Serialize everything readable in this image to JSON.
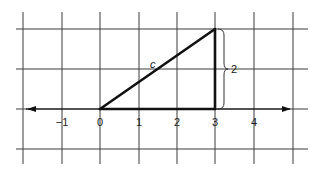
{
  "diagram": {
    "type": "coordinate-grid-right-triangle",
    "x_axis": {
      "tick_labels": [
        "−1",
        "0",
        "1",
        "2",
        "3",
        "4"
      ],
      "tick_values": [
        -1,
        0,
        1,
        2,
        3,
        4
      ],
      "arrows": "both"
    },
    "triangle": {
      "vertices": [
        [
          0,
          0
        ],
        [
          3,
          0
        ],
        [
          3,
          2
        ]
      ],
      "hypotenuse_label": "c",
      "vertical_leg_label": "2"
    },
    "colors": {
      "grid": "#3a3a3a",
      "triangle": "#111111",
      "background": "#ffffff"
    }
  }
}
